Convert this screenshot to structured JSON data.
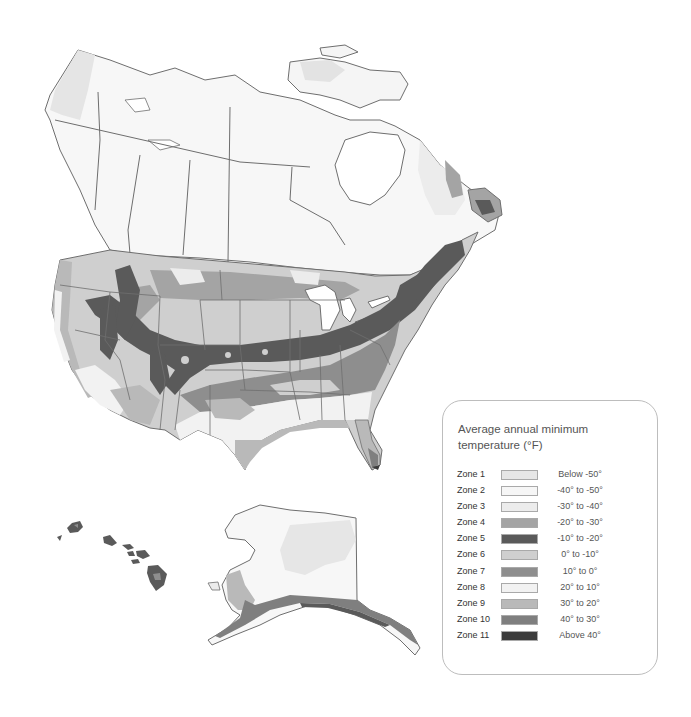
{
  "map": {
    "subject": "North America plant hardiness zones",
    "insets": [
      "Hawaii",
      "Alaska"
    ],
    "border_color": "#6e6e6e",
    "water_color": "#ffffff"
  },
  "legend": {
    "title": "Average annual minimum temperature (°F)",
    "zones": [
      {
        "label": "Zone 1",
        "range": "Below -50°",
        "color": "#e6e6e6"
      },
      {
        "label": "Zone 2",
        "range": "-40° to -50°",
        "color": "#f6f6f6"
      },
      {
        "label": "Zone 3",
        "range": "-30° to -40°",
        "color": "#ececec"
      },
      {
        "label": "Zone 4",
        "range": "-20° to -30°",
        "color": "#a4a4a4"
      },
      {
        "label": "Zone 5",
        "range": "-10° to -20°",
        "color": "#5a5a5a"
      },
      {
        "label": "Zone 6",
        "range": "0° to -10°",
        "color": "#cfcfcf"
      },
      {
        "label": "Zone 7",
        "range": "10° to 0°",
        "color": "#8e8e8e"
      },
      {
        "label": "Zone 8",
        "range": "20° to 10°",
        "color": "#f2f2f2"
      },
      {
        "label": "Zone 9",
        "range": "30° to 20°",
        "color": "#b9b9b9"
      },
      {
        "label": "Zone 10",
        "range": "40° to 30°",
        "color": "#7f7f7f"
      },
      {
        "label": "Zone 11",
        "range": "Above 40°",
        "color": "#3c3c3c"
      }
    ]
  }
}
